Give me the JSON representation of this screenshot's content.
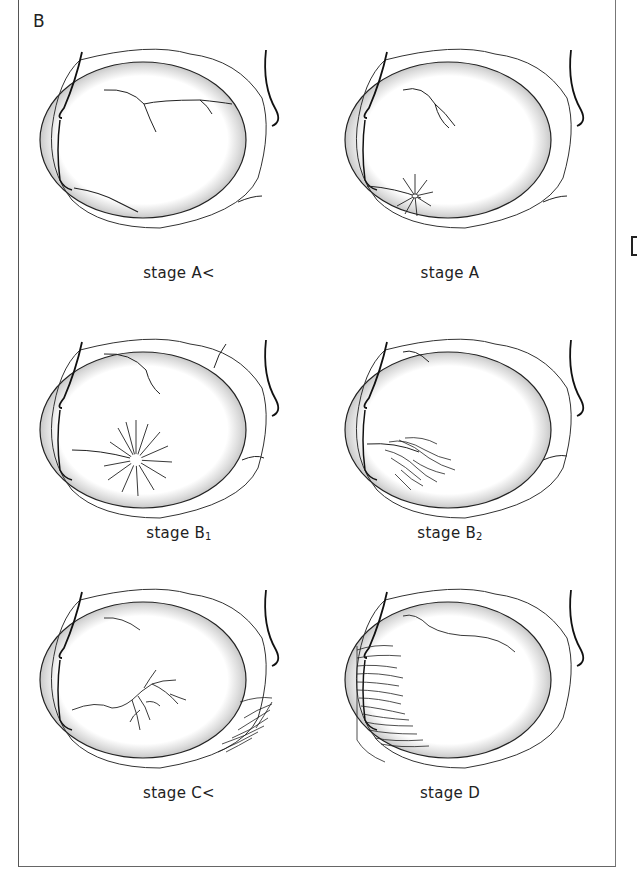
{
  "figure": {
    "panel_letter": "B",
    "edge_glyph": "D",
    "stages": [
      {
        "id": "a-less",
        "label": "stage A<",
        "sub": "",
        "finding": "few vessels, no neovascular focus"
      },
      {
        "id": "a",
        "label": "stage A",
        "sub": "",
        "finding": "small radial neovascular focus"
      },
      {
        "id": "b1",
        "label": "stage B",
        "sub": "1",
        "finding": "larger radial (sea-fan) neovascular focus"
      },
      {
        "id": "b2",
        "label": "stage B",
        "sub": "2",
        "finding": "tangled neovascular membrane"
      },
      {
        "id": "c-less",
        "label": "stage C<",
        "sub": "",
        "finding": "branching vessels and peripheral neovascularization"
      },
      {
        "id": "d",
        "label": "stage D",
        "sub": "",
        "finding": "extensive peripheral neovascular fringe"
      }
    ]
  }
}
